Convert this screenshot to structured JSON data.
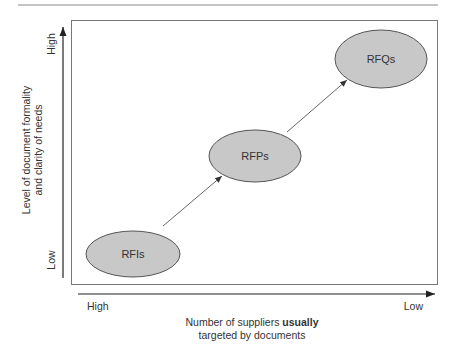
{
  "diagram": {
    "type": "positioning-matrix",
    "nodes": [
      {
        "id": "rfis",
        "label": "RFIs",
        "cx": 133,
        "cy": 254,
        "rx": 47,
        "ry": 23
      },
      {
        "id": "rfps",
        "label": "RFPs",
        "cx": 255,
        "cy": 156,
        "rx": 46,
        "ry": 26
      },
      {
        "id": "rfqs",
        "label": "RFQs",
        "cx": 381,
        "cy": 59,
        "rx": 46,
        "ry": 29
      }
    ],
    "edges": [
      {
        "from": "rfis",
        "to": "rfps"
      },
      {
        "from": "rfps",
        "to": "rfqs"
      }
    ],
    "y_axis": {
      "label_line1": "Level of document formality",
      "label_line2": "and clarity of needs",
      "high": "High",
      "low": "Low"
    },
    "x_axis": {
      "label_prefix": "Number of suppliers ",
      "label_bold": "usually",
      "label_line2": "targeted by documents",
      "high": "High",
      "low": "Low"
    },
    "colors": {
      "node_fill": "#c8c8c8",
      "node_stroke": "#555555",
      "line": "#555555",
      "frame": "#777777",
      "rule": "#888888",
      "text": "#333333"
    }
  }
}
